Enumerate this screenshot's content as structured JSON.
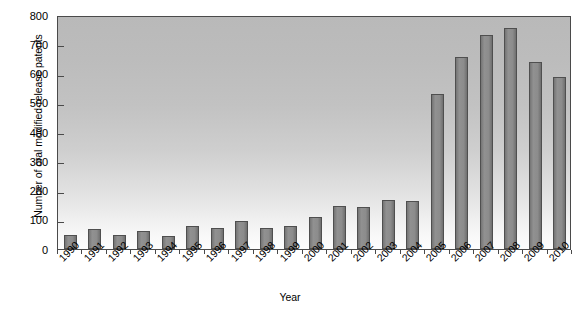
{
  "chart_data": {
    "type": "bar",
    "title": "",
    "subtitle": "",
    "xlabel": "Year",
    "ylabel": "Number of oral modified-release patents",
    "categories": [
      "1990",
      "1991",
      "1992",
      "1993",
      "1994",
      "1995",
      "1996",
      "1997",
      "1998",
      "1999",
      "2000",
      "2001",
      "2002",
      "2003",
      "2004",
      "2005",
      "2006",
      "2007",
      "2008",
      "2009",
      "2010"
    ],
    "values": [
      48,
      70,
      48,
      60,
      45,
      78,
      72,
      97,
      72,
      80,
      110,
      148,
      143,
      167,
      165,
      530,
      655,
      730,
      755,
      640,
      588
    ],
    "series": [
      {
        "name": "Oral modified-release patents",
        "values": [
          48,
          70,
          48,
          60,
          45,
          78,
          72,
          97,
          72,
          80,
          110,
          148,
          143,
          167,
          165,
          530,
          655,
          730,
          755,
          640,
          588
        ]
      }
    ],
    "ylim": [
      0,
      800
    ],
    "ytick_step": 100,
    "yticks": [
      0,
      100,
      200,
      300,
      400,
      500,
      600,
      700,
      800
    ],
    "ytick_labels": [
      "0",
      "100",
      "200",
      "300",
      "400",
      "500",
      "600",
      "700",
      "800"
    ],
    "grid": false,
    "legend": false,
    "legend_position": "none",
    "bar_color": "#8a8a8a",
    "bar_edge_color": "#4f4f4f",
    "plot_bg_top_color": "#b9b9b9",
    "plot_bg_bottom_color": "#fdfdfd",
    "axis_color": "#4a4a4a",
    "xtick_label_rotation": -45
  }
}
